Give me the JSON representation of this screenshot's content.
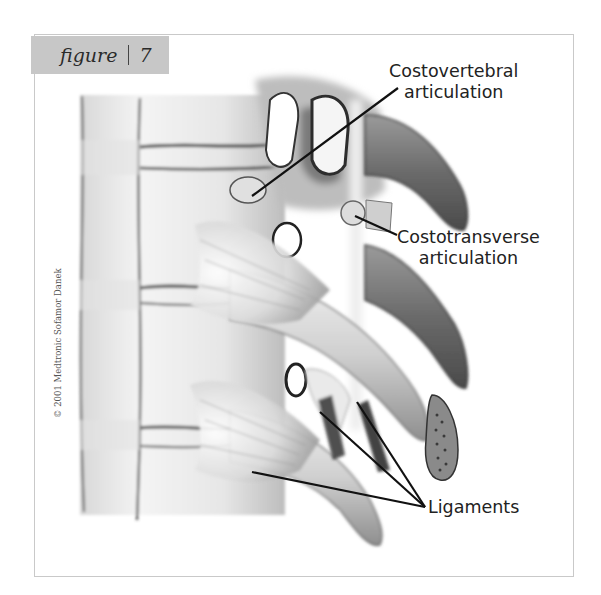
{
  "figure": {
    "label_word": "figure",
    "label_number": "7",
    "label_bg_color": "#c7c7c7",
    "frame_border_color": "#c9c9c9"
  },
  "callouts": [
    {
      "id": "costovertebral",
      "line1": "Costovertebral",
      "line2": "articulation"
    },
    {
      "id": "costotransverse",
      "line1": "Costotransverse",
      "line2": "articulation"
    },
    {
      "id": "ligaments",
      "line1": "Ligaments"
    }
  ],
  "copyright": "© 2001 Medtronic Sofamor Danek",
  "illustration": {
    "subject": "Lateral view of thoracic spine showing rib articulations and ligaments",
    "style": "grayscale pencil/airbrush medical illustration"
  }
}
